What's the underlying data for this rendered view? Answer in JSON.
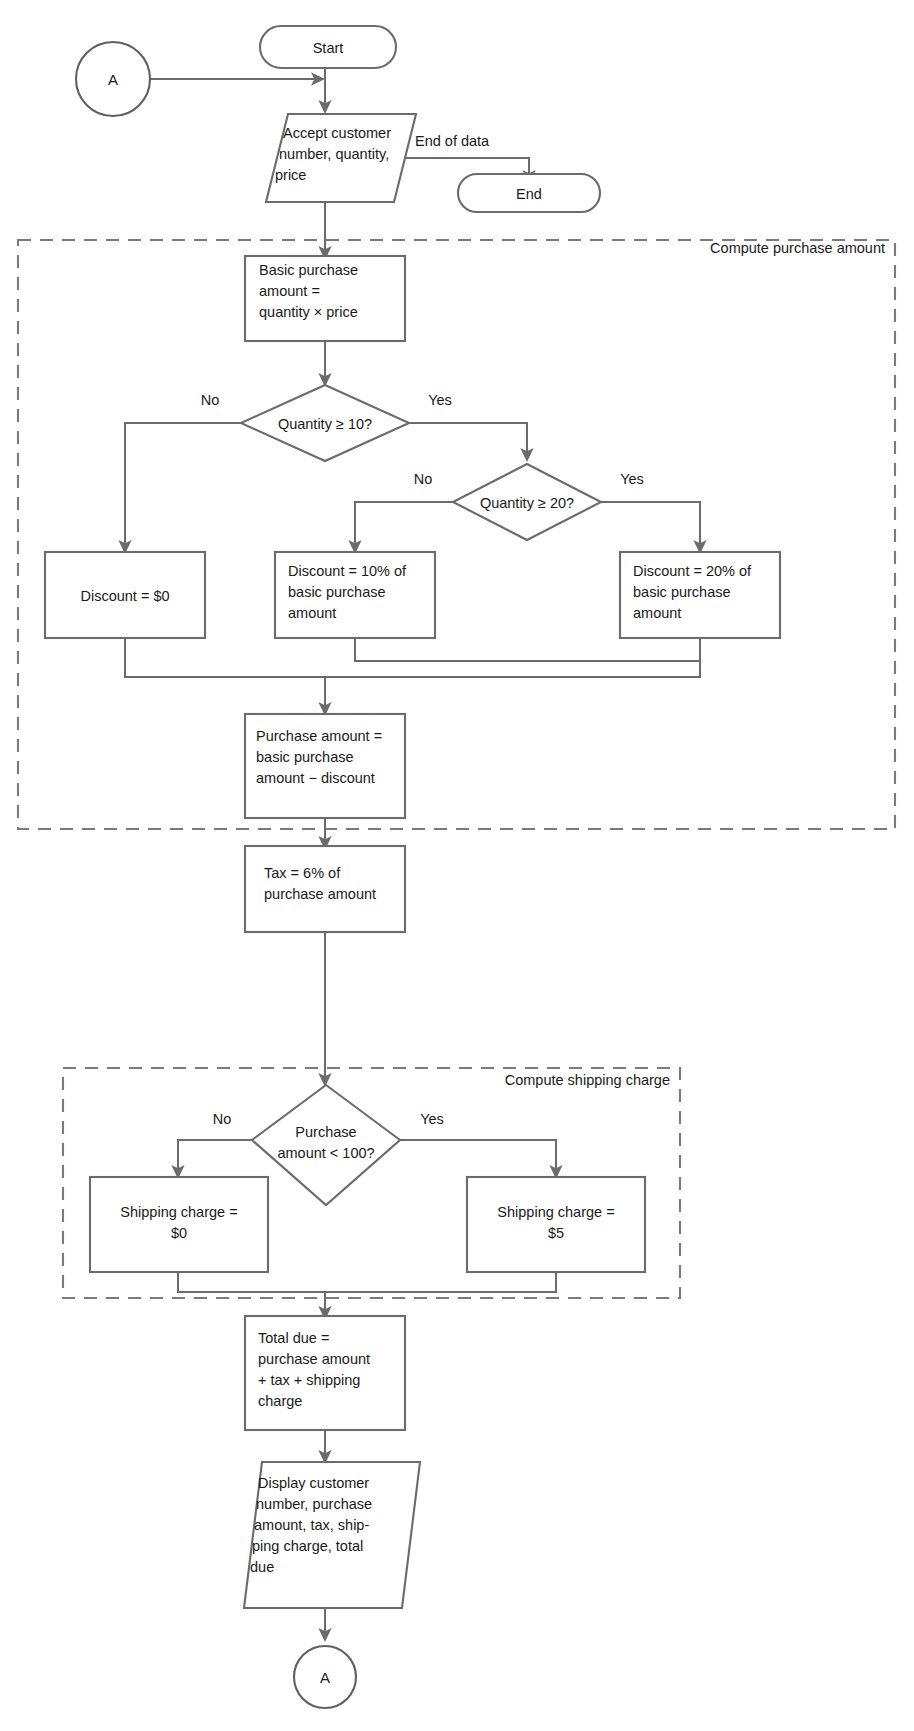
{
  "diagram": {
    "type": "flowchart",
    "colors": {
      "stroke": "#6b6b6b",
      "dashed_stroke": "#7a7a7a",
      "text": "#1a1a1a",
      "background": "#ffffff"
    }
  },
  "nodes": {
    "connector_top": {
      "label": "A",
      "shape": "circle"
    },
    "start": {
      "label": "Start",
      "shape": "terminator"
    },
    "accept": {
      "shape": "input-output",
      "lines": [
        "Accept customer",
        "number, quantity,",
        "price"
      ]
    },
    "end": {
      "label": "End",
      "shape": "terminator"
    },
    "basic_purchase": {
      "shape": "process",
      "lines": [
        "Basic purchase",
        "amount  =",
        "quantity  ×  price"
      ]
    },
    "decision_qty10": {
      "shape": "decision",
      "lines": [
        "Quantity  ≥  10?"
      ]
    },
    "decision_qty20": {
      "shape": "decision",
      "lines": [
        "Quantity  ≥  20?"
      ]
    },
    "discount_zero": {
      "shape": "process",
      "lines": [
        "Discount  =  $0"
      ]
    },
    "discount_ten": {
      "shape": "process",
      "lines": [
        "Discount  =  10% of",
        "basic purchase",
        "amount"
      ]
    },
    "discount_twenty": {
      "shape": "process",
      "lines": [
        "Discount  =  20% of",
        "basic purchase",
        "amount"
      ]
    },
    "purchase_amount": {
      "shape": "process",
      "lines": [
        "Purchase amount  =",
        "basic purchase",
        "amount  −  discount"
      ]
    },
    "tax": {
      "shape": "process",
      "lines": [
        "Tax  =  6% of",
        "purchase amount"
      ]
    },
    "decision_purchase100": {
      "shape": "decision",
      "lines": [
        "Purchase",
        "amount  <  100?"
      ]
    },
    "shipping_zero": {
      "shape": "process",
      "lines": [
        "Shipping charge  =",
        "$0"
      ]
    },
    "shipping_five": {
      "shape": "process",
      "lines": [
        "Shipping charge  =",
        "$5"
      ]
    },
    "total_due": {
      "shape": "process",
      "lines": [
        "Total due  =",
        "purchase amount",
        "+  tax  +  shipping",
        "charge"
      ]
    },
    "display": {
      "shape": "input-output",
      "lines": [
        "Display customer",
        "number, purchase",
        "amount, tax, ship-",
        "ping charge, total",
        "due"
      ]
    },
    "connector_bottom": {
      "label": "A",
      "shape": "circle"
    }
  },
  "regions": {
    "compute_purchase": {
      "label": "Compute purchase amount"
    },
    "compute_shipping": {
      "label": "Compute shipping charge"
    }
  },
  "edge_labels": {
    "end_of_data": "End of data",
    "qty10_no": "No",
    "qty10_yes": "Yes",
    "qty20_no": "No",
    "qty20_yes": "Yes",
    "purchase100_no": "No",
    "purchase100_yes": "Yes"
  }
}
